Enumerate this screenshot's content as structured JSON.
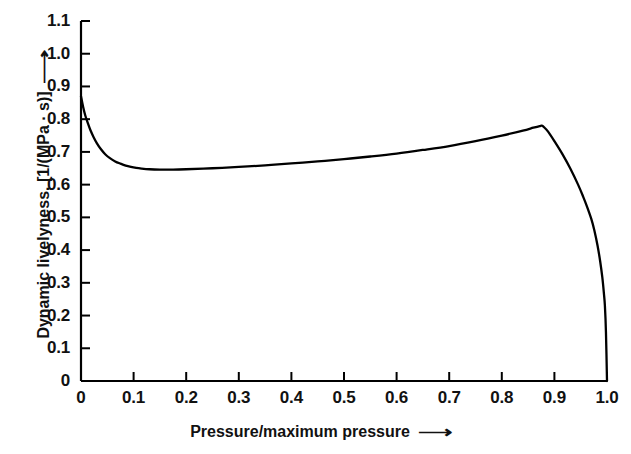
{
  "chart_data": {
    "type": "line",
    "title": "",
    "xlabel": "Pressure/maximum pressure",
    "ylabel": "Dynamic livelyness, [1/(MPa · s)]",
    "xlabel_arrow": "⟶",
    "ylabel_arrow": "⟶",
    "xlim": [
      0,
      1.0
    ],
    "ylim": [
      0,
      1.1
    ],
    "grid": false,
    "legend": "none",
    "line_color": "#000000",
    "background_color": "#ffffff",
    "axis_color": "#000000",
    "xticks": [
      0,
      0.1,
      0.2,
      0.3,
      0.4,
      0.5,
      0.6,
      0.7,
      0.8,
      0.9,
      1.0
    ],
    "xtick_labels": [
      "0",
      "0.1",
      "0.2",
      "0.3",
      "0.4",
      "0.5",
      "0.6",
      "0.7",
      "0.8",
      "0.9",
      "1.0"
    ],
    "yticks": [
      0,
      0.1,
      0.2,
      0.3,
      0.4,
      0.5,
      0.6,
      0.7,
      0.8,
      0.9,
      1.0,
      1.1
    ],
    "ytick_labels": [
      "0",
      "0.1",
      "0.2",
      "0.3",
      "0.4",
      "0.5",
      "0.6",
      "0.7",
      "0.8",
      "0.9",
      "1.0",
      "1.1"
    ],
    "series": [
      {
        "name": "Dynamic livelyness",
        "x": [
          0.0,
          0.004,
          0.008,
          0.013,
          0.018,
          0.024,
          0.03,
          0.038,
          0.046,
          0.055,
          0.065,
          0.075,
          0.085,
          0.095,
          0.105,
          0.115,
          0.13,
          0.15,
          0.175,
          0.2,
          0.25,
          0.3,
          0.35,
          0.4,
          0.45,
          0.5,
          0.55,
          0.6,
          0.65,
          0.7,
          0.75,
          0.8,
          0.84,
          0.86,
          0.872,
          0.876,
          0.88,
          0.888,
          0.9,
          0.915,
          0.93,
          0.945,
          0.955,
          0.962,
          0.97,
          0.976,
          0.982,
          0.987,
          0.991,
          0.994,
          0.996,
          0.998,
          1.0
        ],
        "y": [
          0.87,
          0.838,
          0.812,
          0.788,
          0.766,
          0.745,
          0.727,
          0.708,
          0.693,
          0.681,
          0.671,
          0.664,
          0.658,
          0.654,
          0.651,
          0.649,
          0.647,
          0.646,
          0.646,
          0.647,
          0.65,
          0.654,
          0.659,
          0.665,
          0.671,
          0.678,
          0.686,
          0.695,
          0.706,
          0.718,
          0.733,
          0.75,
          0.765,
          0.774,
          0.779,
          0.78,
          0.776,
          0.762,
          0.733,
          0.694,
          0.65,
          0.6,
          0.562,
          0.533,
          0.496,
          0.46,
          0.414,
          0.366,
          0.318,
          0.27,
          0.23,
          0.15,
          0.0
        ]
      }
    ],
    "annotations": {
      "start_value": 0.87,
      "minimum": {
        "x": 0.145,
        "y": 0.6455
      },
      "peak": {
        "x": 0.876,
        "y": 0.78
      },
      "end": {
        "x": 1.0,
        "y": 0.0
      }
    }
  }
}
